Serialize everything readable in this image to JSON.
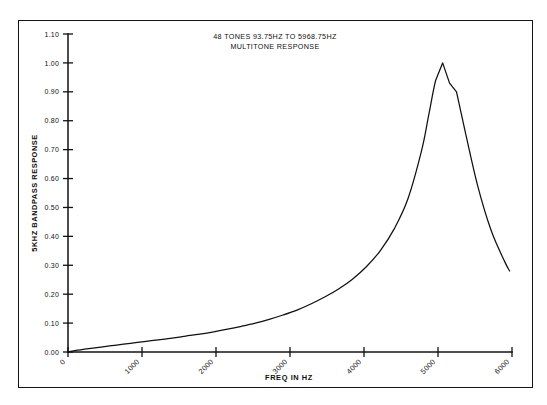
{
  "figure": {
    "title_line1": "48 TONES 93.75HZ TO 5968.75HZ",
    "title_line2": "MULTITONE RESPONSE",
    "border_color": "#141414",
    "curve_color": "#101010",
    "background": "#ffffff"
  },
  "chart_data": {
    "type": "line",
    "title": "48 TONES 93.75HZ TO 5968.75HZ MULTITONE RESPONSE",
    "xlabel": "FREQ IN HZ",
    "ylabel": "5KHZ BANDPASS RESPONSE",
    "xlim": [
      0,
      6000
    ],
    "ylim": [
      0.0,
      1.1
    ],
    "grid": false,
    "legend": null,
    "xticks": [
      0,
      1000,
      2000,
      3000,
      4000,
      5000,
      6000
    ],
    "xtick_labels": [
      "0",
      "1000",
      "2000",
      "3000",
      "4000",
      "5000",
      "6000"
    ],
    "xtick_rotation": 45,
    "yticks": [
      0.0,
      0.1,
      0.2,
      0.3,
      0.4,
      0.5,
      0.6,
      0.7,
      0.8,
      0.9,
      1.0,
      1.1
    ],
    "ytick_labels": [
      "0.00",
      "0.10",
      "0.20",
      "0.30",
      "0.40",
      "0.50",
      "0.60",
      "0.70",
      "0.80",
      "0.90",
      "1.00",
      "1.10"
    ],
    "series": [
      {
        "name": "5KHZ bandpass response",
        "x": [
          0,
          93.75,
          281.25,
          468.75,
          656.25,
          843.75,
          1031.25,
          1218.75,
          1406.25,
          1593.75,
          1781.25,
          1968.75,
          2156.25,
          2343.75,
          2531.25,
          2718.75,
          2906.25,
          3093.75,
          3281.25,
          3468.75,
          3656.25,
          3843.75,
          4031.25,
          4218.75,
          4406.25,
          4593.75,
          4781.25,
          4875.0,
          4968.75,
          5062.5,
          5156.25,
          5250.0,
          5343.75,
          5531.25,
          5718.75,
          5906.25,
          5968.75
        ],
        "y": [
          0.0,
          0.005,
          0.012,
          0.018,
          0.024,
          0.03,
          0.036,
          0.042,
          0.048,
          0.055,
          0.062,
          0.07,
          0.079,
          0.089,
          0.1,
          0.113,
          0.128,
          0.145,
          0.166,
          0.19,
          0.218,
          0.252,
          0.295,
          0.35,
          0.425,
          0.53,
          0.7,
          0.82,
          0.94,
          1.0,
          0.93,
          0.9,
          0.79,
          0.58,
          0.42,
          0.31,
          0.28
        ]
      }
    ]
  }
}
